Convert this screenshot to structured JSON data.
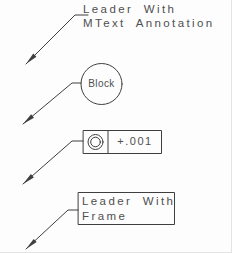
{
  "colors": {
    "line": "#3f3f3f",
    "text": "#4f4f4f",
    "background": "#fdfdfd"
  },
  "drawing": {
    "mtext_leader": {
      "line1": "Leader With",
      "line2": "MText Annotation"
    },
    "block_leader": {
      "label": "Block"
    },
    "tolerance_leader": {
      "symbol": "concentricity",
      "value": "+.001"
    },
    "frame_leader": {
      "line1": "Leader With",
      "line2": "Frame"
    }
  }
}
